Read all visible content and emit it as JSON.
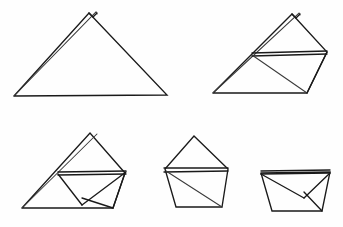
{
  "document": {
    "title": "Paper Folding Sequence",
    "kind": "line-art-diagram",
    "panel_count": 5,
    "canvas": {
      "width": 343,
      "height": 227
    },
    "background_color": "#fefefe",
    "stroke_color": "#1a1a1a",
    "stroke_color_secondary": "#3a3a3a",
    "stroke_width": 1.35
  },
  "panels": [
    {
      "id": "panel-1",
      "name": "step-1-folded-triangle",
      "label": "",
      "row": "top",
      "column": "left",
      "description": "Wide isosceles triangle with a small notch at the apex formed by two overlapping layers",
      "shapes": [
        {
          "name": "outer-triangle",
          "type": "polyline",
          "points": "14,96 89,13 167,95 14,96"
        },
        {
          "name": "apex-overlap-edge",
          "type": "polyline",
          "points": "14,96 96,12 97,14"
        },
        {
          "name": "apex-notch",
          "type": "polyline",
          "points": "89,13 93,17 97,13"
        }
      ]
    },
    {
      "id": "panel-2",
      "name": "step-2-corner-folded-up",
      "label": "",
      "row": "top",
      "column": "right",
      "description": "Same triangle with the right corner folded upward creating a horizontal band and an inner diagonal",
      "shapes": [
        {
          "name": "outer-triangle",
          "type": "polyline",
          "points": "213,93 292,14 327,52 307,93 213,93"
        },
        {
          "name": "apex-overlap-edge",
          "type": "polyline",
          "points": "213,93 299,13 300,15"
        },
        {
          "name": "apex-notch",
          "type": "polyline",
          "points": "292,14 296,18 300,14"
        },
        {
          "name": "horizontal-band-top",
          "type": "polyline",
          "points": "252,53 327,51"
        },
        {
          "name": "horizontal-band-bottom",
          "type": "polyline",
          "points": "252,56 327,54"
        },
        {
          "name": "inner-diagonal",
          "type": "polyline",
          "points": "252,55 307,93"
        },
        {
          "name": "right-edge",
          "type": "polyline",
          "points": "327,52 307,93"
        }
      ]
    },
    {
      "id": "panel-3",
      "name": "step-3-envelope-fold",
      "label": "",
      "row": "bottom",
      "column": "left",
      "description": "Triangle with an inner envelope-shaped fold, horizontal band and a downward V crease",
      "shapes": [
        {
          "name": "outer-triangle",
          "type": "polyline",
          "points": "22,208 90,133 125,173 113,208 22,208"
        },
        {
          "name": "overlap-edge",
          "type": "polyline",
          "points": "22,208 97,134"
        },
        {
          "name": "horizontal-band-top",
          "type": "polyline",
          "points": "58,172 126,171"
        },
        {
          "name": "horizontal-band-bottom",
          "type": "polyline",
          "points": "58,175 126,174"
        },
        {
          "name": "envelope-left-crease",
          "type": "polyline",
          "points": "58,174 82,205"
        },
        {
          "name": "envelope-right-crease",
          "type": "polyline",
          "points": "82,205 126,172"
        },
        {
          "name": "inner-flap-edge",
          "type": "polyline",
          "points": "82,198 113,208"
        },
        {
          "name": "right-side-edge",
          "type": "polyline",
          "points": "125,173 113,208"
        }
      ]
    },
    {
      "id": "panel-4",
      "name": "step-4-pentagon-cup",
      "label": "",
      "row": "bottom",
      "column": "center",
      "description": "Pentagon shaped cup with a peaked top, horizontal band and one diagonal crease",
      "shapes": [
        {
          "name": "outer-pentagon",
          "type": "polyline",
          "points": "165,169 194,136 228,169 222,207 176,207 165,169"
        },
        {
          "name": "horizontal-band-top",
          "type": "polyline",
          "points": "164,168 228,168"
        },
        {
          "name": "horizontal-band-bottom",
          "type": "polyline",
          "points": "164,172 228,171"
        },
        {
          "name": "diagonal-crease",
          "type": "polyline",
          "points": "166,171 222,207"
        }
      ]
    },
    {
      "id": "panel-5",
      "name": "step-5-finished-cup",
      "label": "",
      "row": "bottom",
      "column": "right",
      "description": "Trapezoid cup with a V shaped inner fold meeting at the centre",
      "shapes": [
        {
          "name": "outer-trapezoid",
          "type": "polyline",
          "points": "261,173 330,172 322,211 272,211 261,173"
        },
        {
          "name": "rim-top",
          "type": "polyline",
          "points": "261,171 330,170"
        },
        {
          "name": "rim-bottom",
          "type": "polyline",
          "points": "261,174 330,173"
        },
        {
          "name": "v-left-crease",
          "type": "polyline",
          "points": "261,174 304,198"
        },
        {
          "name": "v-right-crease",
          "type": "polyline",
          "points": "304,198 330,173"
        },
        {
          "name": "inner-flap-edge",
          "type": "polyline",
          "points": "304,192 322,211"
        }
      ]
    }
  ]
}
